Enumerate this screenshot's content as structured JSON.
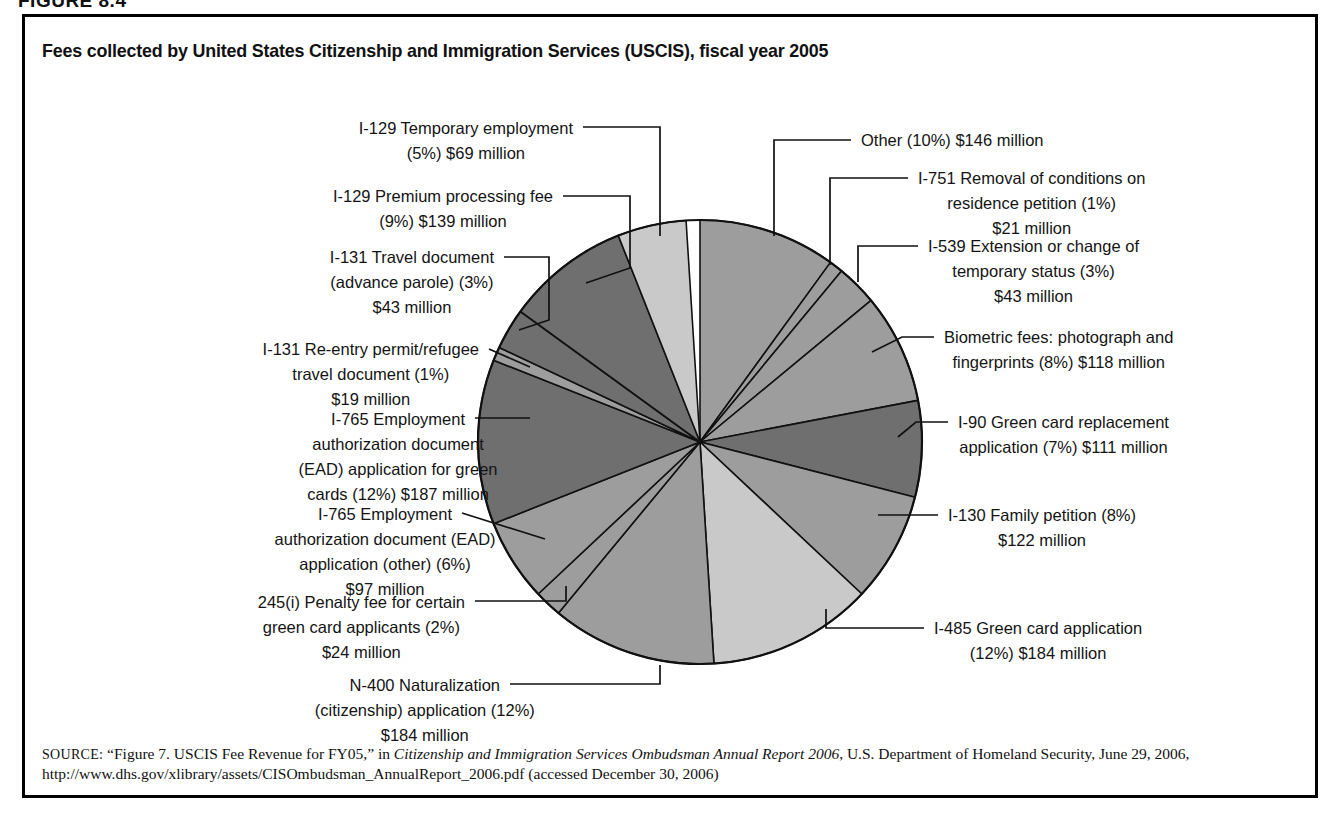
{
  "figure": {
    "number_label": "FIGURE 8.4",
    "title": "Fees collected by United States Citizenship and Immigration Services (USCIS), fiscal year 2005"
  },
  "source": {
    "prefix": "SOURCE:",
    "quoted_title": "“Figure 7. USCIS Fee Revenue for FY05,”",
    "in_word": "in",
    "italic_title": "Citizenship and Immigration Services Ombudsman Annual Report 2006",
    "publisher": ", U.S. Department of Homeland Security, June 29, 2006, http://www.dhs.gov/xlibrary/assets/CISOmbudsman_AnnualReport_2006.pdf (accessed December 30, 2006)"
  },
  "palette": {
    "light": "#c9c9c9",
    "medium": "#9d9d9d",
    "dark": "#6f6f6f",
    "stroke": "#111111",
    "background": "#ffffff",
    "frame": "#000000"
  },
  "chart_data": {
    "type": "pie",
    "title": "Fees collected by United States Citizenship and Immigration Services (USCIS), fiscal year 2005",
    "unit": "millions of dollars",
    "start_angle_deg": 0,
    "direction": "clockwise",
    "legend": "none (direct labels with leader lines)",
    "categories": [
      "I-751 Removal of conditions on residence petition",
      "I-539 Extension or change of temporary status",
      "Biometric fees: photograph and fingerprints",
      "I-90 Green card replacement application",
      "I-130 Family petition",
      "I-485 Green card application",
      "N-400 Naturalization (citizenship) application",
      "245(i) Penalty fee for certain green card applicants",
      "I-765 Employment authorization document (EAD) application (other)",
      "I-765 Employment authorization document (EAD) application for green cards",
      "I-131 Re-entry permit/refugee travel document",
      "I-131 Travel document (advance parole)",
      "I-129 Premium processing fee",
      "I-129 Temporary employment",
      "Other"
    ],
    "values": [
      21,
      43,
      118,
      111,
      122,
      184,
      184,
      24,
      97,
      187,
      19,
      43,
      139,
      69,
      146
    ],
    "percents": [
      1,
      3,
      8,
      7,
      8,
      12,
      12,
      2,
      6,
      12,
      1,
      3,
      9,
      5,
      10
    ],
    "value_labels": [
      "$21 million",
      "$43 million",
      "$118 million",
      "$111 million",
      "$122 million",
      "$184 million",
      "$184 million",
      "$24 million",
      "$97 million",
      "$187 million",
      "$19 million",
      "$43 million",
      "$139 million",
      "$69 million",
      "$146 million"
    ],
    "slices": [
      {
        "id": "other",
        "pct": 10,
        "shade": "medium"
      },
      {
        "id": "i751",
        "pct": 1,
        "shade": "medium"
      },
      {
        "id": "i539",
        "pct": 3,
        "shade": "medium"
      },
      {
        "id": "biometric",
        "pct": 8,
        "shade": "medium"
      },
      {
        "id": "i90",
        "pct": 7,
        "shade": "dark"
      },
      {
        "id": "i130",
        "pct": 8,
        "shade": "medium"
      },
      {
        "id": "i485",
        "pct": 12,
        "shade": "light"
      },
      {
        "id": "n400",
        "pct": 12,
        "shade": "medium"
      },
      {
        "id": "penalty245i",
        "pct": 2,
        "shade": "medium"
      },
      {
        "id": "i765other",
        "pct": 6,
        "shade": "medium"
      },
      {
        "id": "i765green",
        "pct": 12,
        "shade": "dark"
      },
      {
        "id": "i131reentry",
        "pct": 1,
        "shade": "medium"
      },
      {
        "id": "i131travel",
        "pct": 3,
        "shade": "dark"
      },
      {
        "id": "i129premium",
        "pct": 9,
        "shade": "dark"
      },
      {
        "id": "i129temp",
        "pct": 5,
        "shade": "light"
      }
    ]
  },
  "labels": {
    "i129temp": {
      "lines": [
        "I-129 Temporary employment",
        "(5%) $69 million"
      ]
    },
    "i129premium": {
      "lines": [
        "I-129 Premium processing fee",
        "(9%) $139 million"
      ]
    },
    "i131travel": {
      "lines": [
        "I-131 Travel document",
        "(advance parole) (3%)",
        "$43 million"
      ]
    },
    "i131reentry": {
      "lines": [
        "I-131 Re-entry permit/refugee",
        "travel document (1%)",
        "$19 million"
      ]
    },
    "i765green": {
      "lines": [
        "I-765 Employment",
        "authorization document",
        "(EAD) application for green",
        "cards (12%) $187 million"
      ]
    },
    "i765other": {
      "lines": [
        "I-765 Employment",
        "authorization document (EAD)",
        "application (other) (6%)",
        "$97 million"
      ]
    },
    "penalty245i": {
      "lines": [
        "245(i) Penalty fee for certain",
        "green card applicants (2%)",
        "$24 million"
      ]
    },
    "n400": {
      "lines": [
        "N-400 Naturalization",
        "(citizenship) application (12%)",
        "$184 million"
      ]
    },
    "other": {
      "lines": [
        "Other (10%) $146 million"
      ]
    },
    "i751": {
      "lines": [
        "I-751 Removal of conditions on",
        "residence petition (1%)",
        "$21 million"
      ]
    },
    "i539": {
      "lines": [
        "I-539 Extension or change of",
        "temporary status (3%)",
        "$43 million"
      ]
    },
    "biometric": {
      "lines": [
        "Biometric fees: photograph and",
        "fingerprints (8%) $118 million"
      ]
    },
    "i90": {
      "lines": [
        "I-90 Green card replacement",
        "application (7%) $111 million"
      ]
    },
    "i130": {
      "lines": [
        "I-130 Family petition (8%)",
        "$122 million"
      ]
    },
    "i485": {
      "lines": [
        "I-485 Green card application",
        "(12%) $184 million"
      ]
    }
  }
}
